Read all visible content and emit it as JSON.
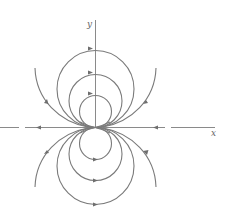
{
  "figure": {
    "type": "phase-portrait",
    "axes": {
      "x_label": "x",
      "y_label": "y"
    },
    "colors": {
      "curve": "#7a7a7a",
      "axis": "#8a8a8a",
      "label": "#666666"
    },
    "trajectories": {
      "upper_circles": {
        "count": 3,
        "tangent_at": "origin",
        "arrow_direction": "right at top"
      },
      "lower_circles": {
        "count": 3,
        "tangent_at": "origin",
        "arrow_direction": "right at bottom"
      },
      "outer_open_curves": {
        "count": 4,
        "arrow_direction": "away from origin on left, toward origin on right"
      },
      "x_axis_rays": {
        "left": "pointing left (away from origin)",
        "right": "pointing left (toward origin)"
      }
    }
  }
}
